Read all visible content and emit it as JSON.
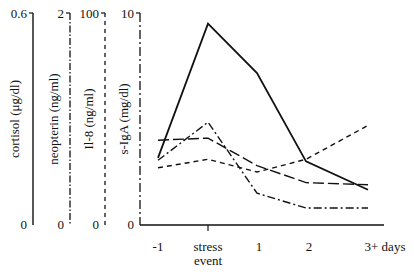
{
  "chart_data": {
    "type": "line",
    "title": "",
    "xlabel": "days",
    "categories": [
      "-1",
      "stress event",
      "1",
      "2",
      "3+ days"
    ],
    "axes": [
      {
        "name": "cortisol",
        "label": "cortisol (μg/dl)",
        "max_label": "0.6",
        "min_label": "0",
        "ylim": [
          0,
          0.6
        ],
        "style": "solid"
      },
      {
        "name": "neopterin",
        "label": "neopterin (ng/ml)",
        "max_label": "2",
        "min_label": "0",
        "ylim": [
          0,
          2
        ],
        "style": "dash-dot"
      },
      {
        "name": "il8",
        "label": "Il-8 (ng/ml)",
        "max_label": "100",
        "min_label": "0",
        "ylim": [
          0,
          100
        ],
        "style": "short-dash"
      },
      {
        "name": "sigA",
        "label": "s-IgA (mg/dl)",
        "max_label": "10",
        "min_label": "0",
        "ylim": [
          0,
          10
        ],
        "style": "long-dash"
      }
    ],
    "series": [
      {
        "name": "cortisol",
        "style": "solid",
        "values": [
          0.19,
          0.57,
          0.43,
          0.18,
          0.1
        ]
      },
      {
        "name": "neopterin",
        "style": "dash-dot",
        "values": [
          0.61,
          0.97,
          0.3,
          0.16,
          0.16
        ]
      },
      {
        "name": "Il-8",
        "style": "short-dash",
        "values": [
          27,
          31,
          25,
          31,
          47
        ]
      },
      {
        "name": "s-IgA",
        "style": "long-dash",
        "values": [
          4.0,
          4.1,
          2.8,
          2.0,
          1.9
        ]
      }
    ],
    "grid": false,
    "legend": "none"
  },
  "x_ticks": {
    "t0": "-1",
    "t1a": "stress",
    "t1b": "event",
    "t2": "1",
    "t3": "2",
    "t4": "3+ days"
  }
}
